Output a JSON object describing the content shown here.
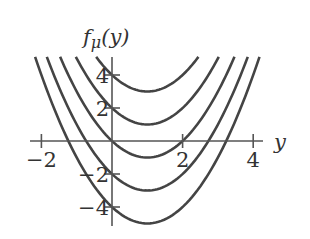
{
  "chart_data": {
    "type": "line",
    "title": "",
    "ylabel_prefix": "f",
    "ylabel_sub": "μ",
    "ylabel_suffix": "(y)",
    "xlabel": "y",
    "x_ticks": [
      -2,
      2,
      4
    ],
    "x_tick_labels": [
      "−2",
      "2",
      "4"
    ],
    "y_ticks": [
      4,
      2,
      -2,
      -4
    ],
    "y_tick_labels": [
      "4",
      "2",
      "−2",
      "−4"
    ],
    "xlim": [
      -2.2,
      4.2
    ],
    "ylim": [
      -5,
      5
    ],
    "grid": false,
    "legend": null,
    "formula": "f(y) = y^2 - 2y + c",
    "series": [
      {
        "name": "c=4",
        "c": 4,
        "minimum": {
          "x": 1,
          "y": 3
        }
      },
      {
        "name": "c=2",
        "c": 2,
        "minimum": {
          "x": 1,
          "y": 1
        }
      },
      {
        "name": "c=0",
        "c": 0,
        "minimum": {
          "x": 1,
          "y": -1
        }
      },
      {
        "name": "c=-2",
        "c": -2,
        "minimum": {
          "x": 1,
          "y": -3
        }
      },
      {
        "name": "c=-4",
        "c": -4,
        "minimum": {
          "x": 1,
          "y": -5
        }
      }
    ]
  }
}
